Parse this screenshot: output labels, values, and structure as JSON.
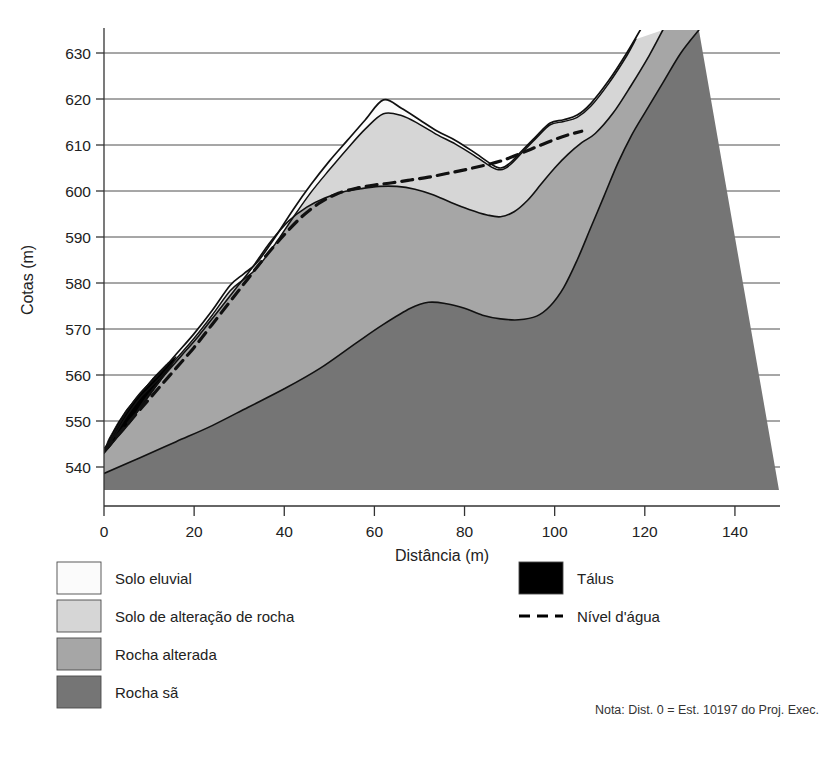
{
  "chart_data": {
    "type": "area",
    "title": "",
    "xlabel": "Distância (m)",
    "ylabel": "Cotas (m)",
    "xlim": [
      0,
      150
    ],
    "ylim": [
      535,
      635
    ],
    "xticks": [
      0,
      20,
      40,
      60,
      80,
      100,
      120,
      140
    ],
    "xtick_labels": [
      "0",
      "20",
      "40",
      "60",
      "80",
      "100",
      "120",
      "140"
    ],
    "yticks": [
      540,
      550,
      560,
      570,
      580,
      590,
      600,
      610,
      620,
      630
    ],
    "ytick_labels": [
      "540",
      "550",
      "560",
      "570",
      "580",
      "590",
      "600",
      "610",
      "620",
      "630"
    ],
    "grid": true,
    "grid_orientation": "horizontal",
    "note": "Nota: Dist. 0 = Est. 10197 do Proj. Exec.",
    "series": [
      {
        "name": "Superfície do terreno",
        "role": "ground-surface",
        "x": [
          0,
          2,
          5,
          8,
          12,
          16,
          20,
          24,
          28,
          31,
          34,
          38,
          42,
          46,
          50,
          54,
          58,
          62,
          66,
          70,
          74,
          78,
          82,
          86,
          88,
          90,
          93,
          96,
          99,
          102,
          105,
          108,
          112,
          116,
          119
        ],
        "y": [
          543.5,
          547,
          552,
          556,
          560,
          564.5,
          569,
          574,
          579.5,
          582,
          584.5,
          590,
          596,
          601.5,
          606.5,
          611,
          615.5,
          619.8,
          618,
          615.5,
          613,
          611,
          608.5,
          605.8,
          605,
          606,
          609,
          612,
          614.8,
          615.5,
          616.5,
          619,
          624,
          630,
          635
        ]
      },
      {
        "name": "Base do solo eluvial",
        "role": "eluvial-base",
        "x": [
          0,
          2,
          5,
          8,
          12,
          16,
          20,
          24,
          28,
          31,
          34,
          38,
          42,
          46,
          50,
          54,
          58,
          62,
          66,
          70,
          74,
          78,
          82,
          86,
          88,
          90,
          93,
          96,
          99,
          102,
          105,
          108,
          112,
          116,
          118
        ],
        "y": [
          543.3,
          546.3,
          551,
          555,
          559,
          563.5,
          568,
          573,
          578.3,
          580.8,
          583.3,
          588.5,
          594.3,
          599.8,
          604.6,
          609.2,
          613.5,
          616.8,
          616.4,
          614.5,
          612.2,
          610.2,
          607.8,
          605.2,
          604.6,
          605.6,
          608.6,
          611.6,
          614.4,
          615.1,
          616,
          618.4,
          623.4,
          629.4,
          633
        ]
      },
      {
        "name": "Topo da rocha alterada",
        "role": "altered-rock-top",
        "x": [
          0,
          3,
          6,
          9,
          13,
          17,
          21,
          25,
          29,
          33,
          37,
          41,
          45,
          49,
          53,
          57,
          61,
          65,
          69,
          73,
          77,
          81,
          85,
          88,
          91,
          94,
          97,
          100,
          103,
          106,
          109,
          113,
          117,
          121,
          124
        ],
        "y": [
          543,
          546.5,
          550,
          554.5,
          559.5,
          564,
          568.5,
          573.5,
          578.5,
          583.5,
          589,
          593.5,
          596.5,
          598.5,
          599.8,
          600.5,
          601,
          601,
          600.4,
          599.2,
          597.5,
          596,
          594.8,
          594.4,
          595.5,
          598,
          601.5,
          605,
          608,
          610.5,
          612.5,
          617,
          623,
          629.5,
          635
        ]
      },
      {
        "name": "Topo da rocha sã",
        "role": "sound-rock-top",
        "x": [
          0,
          8,
          16,
          24,
          32,
          40,
          48,
          56,
          62,
          68,
          72,
          76,
          80,
          84,
          88,
          92,
          96,
          99,
          102,
          105,
          108,
          111,
          114,
          117,
          120,
          124,
          128,
          132
        ],
        "y": [
          538.6,
          542,
          545.5,
          549,
          553,
          557,
          561.5,
          567,
          571,
          574.5,
          575.8,
          575.5,
          574.5,
          573,
          572.2,
          572,
          572.8,
          575,
          579,
          585,
          592,
          599,
          606,
          612,
          617,
          623.5,
          630,
          635
        ]
      },
      {
        "name": "Nível d'água",
        "role": "water-table",
        "style": "dashed",
        "x": [
          0,
          4,
          8,
          12,
          16,
          20,
          24,
          28,
          32,
          36,
          40,
          44,
          48,
          52,
          56,
          60,
          64,
          68,
          72,
          76,
          80,
          84,
          88,
          92,
          96,
          100,
          103,
          106
        ],
        "y": [
          543.8,
          548,
          552.5,
          557,
          561.5,
          566,
          571,
          576,
          581,
          586,
          590.5,
          594.5,
          597.5,
          599.5,
          600.6,
          601.3,
          601.8,
          602.4,
          603,
          603.8,
          604.6,
          605.5,
          606.5,
          608,
          609.6,
          611.2,
          612.2,
          613
        ]
      },
      {
        "name": "Tálus",
        "role": "talus",
        "x": [
          0,
          1,
          3,
          5,
          8,
          11,
          14,
          16,
          15,
          12,
          9,
          6,
          3,
          1,
          0
        ],
        "y": [
          543.5,
          546,
          549.5,
          552.5,
          556,
          559.5,
          562.5,
          564,
          562,
          558,
          554,
          550,
          546.5,
          544,
          543.5
        ]
      }
    ]
  },
  "legend": {
    "left_items": [
      {
        "label": "Solo eluvial",
        "swatch": "#fbfbfb",
        "type": "swatch"
      },
      {
        "label": "Solo de alteração de rocha",
        "swatch": "#d6d6d6",
        "type": "swatch"
      },
      {
        "label": "Rocha alterada",
        "swatch": "#a6a6a6",
        "type": "swatch"
      },
      {
        "label": "Rocha sã",
        "swatch": "#757575",
        "type": "swatch"
      }
    ],
    "right_items": [
      {
        "label": "Tálus",
        "swatch": "#000000",
        "type": "swatch"
      },
      {
        "label": "Nível d'água",
        "swatch": "#000000",
        "type": "dashed-line"
      }
    ]
  },
  "colors": {
    "eluvial": "#fbfbfb",
    "alteration_soil": "#d6d6d6",
    "altered_rock": "#a6a6a6",
    "sound_rock": "#757575",
    "talus": "#000000",
    "axis": "#333333",
    "grid": "#3a3a3a",
    "outline": "#111111"
  }
}
